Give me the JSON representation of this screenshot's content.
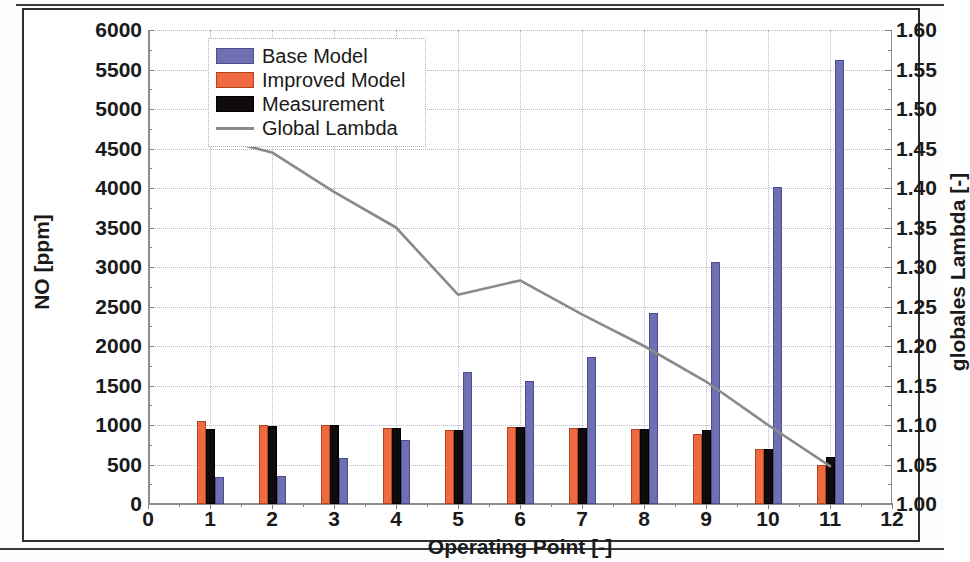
{
  "document": {
    "copyright": "© FKFS & IVK - University of Stuttgart"
  },
  "chart_data": {
    "type": "bar",
    "title": "",
    "xlabel": "Operating Point [-]",
    "ylabel": "NO [ppm]",
    "y2label": "globales Lambda [-]",
    "grid": true,
    "legend_position": "top-left",
    "xlim": [
      0,
      12
    ],
    "ylim": [
      0,
      6000
    ],
    "y2lim": [
      1.0,
      1.6
    ],
    "x_ticks": [
      0,
      1,
      2,
      3,
      4,
      5,
      6,
      7,
      8,
      9,
      10,
      11,
      12
    ],
    "x_tick_labels": [
      "0",
      "1",
      "2",
      "3",
      "4",
      "5",
      "6",
      "7",
      "8",
      "9",
      "10",
      "11",
      "12"
    ],
    "y_ticks": [
      0,
      500,
      1000,
      1500,
      2000,
      2500,
      3000,
      3500,
      4000,
      4500,
      5000,
      5500,
      6000
    ],
    "y_tick_labels": [
      "0",
      "500",
      "1000",
      "1500",
      "2000",
      "2500",
      "3000",
      "3500",
      "4000",
      "4500",
      "5000",
      "5500",
      "6000"
    ],
    "y2_ticks": [
      1.0,
      1.05,
      1.1,
      1.15,
      1.2,
      1.25,
      1.3,
      1.35,
      1.4,
      1.45,
      1.5,
      1.55,
      1.6
    ],
    "y2_tick_labels": [
      "1.00",
      "1.05",
      "1.10",
      "1.15",
      "1.20",
      "1.25",
      "1.30",
      "1.35",
      "1.40",
      "1.45",
      "1.50",
      "1.55",
      "1.60"
    ],
    "categories": [
      1,
      2,
      3,
      4,
      5,
      6,
      7,
      8,
      9,
      10,
      11
    ],
    "series": [
      {
        "name": "Base Model",
        "color": "#6f70b4",
        "axis": "left",
        "values": [
          340,
          350,
          580,
          810,
          1670,
          1560,
          1860,
          2420,
          3060,
          4010,
          5620
        ]
      },
      {
        "name": "Improved Model",
        "color": "#ef6a40",
        "axis": "left",
        "values": [
          1050,
          1000,
          1000,
          960,
          940,
          980,
          960,
          950,
          880,
          700,
          490
        ]
      },
      {
        "name": "Measurement",
        "color": "#100c0c",
        "axis": "left",
        "values": [
          950,
          990,
          1000,
          960,
          940,
          980,
          960,
          950,
          940,
          700,
          600
        ]
      },
      {
        "name": "Global Lambda",
        "color": "#8a8a8a",
        "axis": "right",
        "type": "line",
        "values": [
          1.465,
          1.445,
          1.395,
          1.35,
          1.265,
          1.283,
          1.24,
          1.2,
          1.155,
          1.1,
          1.048
        ]
      }
    ],
    "legend_entries": [
      "Base Model",
      "Improved Model",
      "Measurement",
      "Global Lambda"
    ]
  }
}
